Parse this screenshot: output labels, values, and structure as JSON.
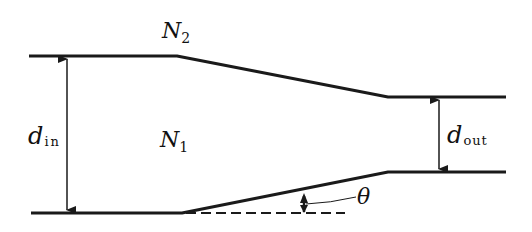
{
  "diagram": {
    "type": "tapered-waveguide-cross-section",
    "labels": {
      "outer_medium": {
        "main": "N",
        "sub": "2"
      },
      "inner_medium": {
        "main": "N",
        "sub": "1"
      },
      "input_width": {
        "main": "d",
        "sub": "in"
      },
      "output_width": {
        "main": "d",
        "sub": "out"
      },
      "taper_angle": "θ"
    },
    "colors": {
      "line": "#1a1a1a",
      "background": "#ffffff"
    }
  }
}
